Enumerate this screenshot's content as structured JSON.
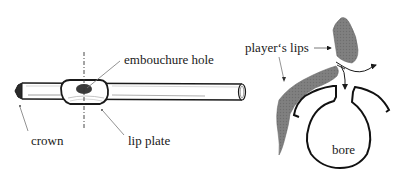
{
  "figure": {
    "left_panel": {
      "title": "flute headjoint",
      "labels": {
        "embouchure_hole": "embouchure hole",
        "crown": "crown",
        "lip_plate": "lip plate"
      }
    },
    "right_panel": {
      "title": "cross-section at embouchure",
      "labels": {
        "players_lips": "player‘s lips",
        "bore": "bore"
      }
    },
    "colors": {
      "line": "#1a1a1a",
      "lip_fill": "#7a7a7a",
      "hole_fill": "#3a3a3a",
      "pointer": "#777777",
      "background": "#ffffff"
    }
  }
}
